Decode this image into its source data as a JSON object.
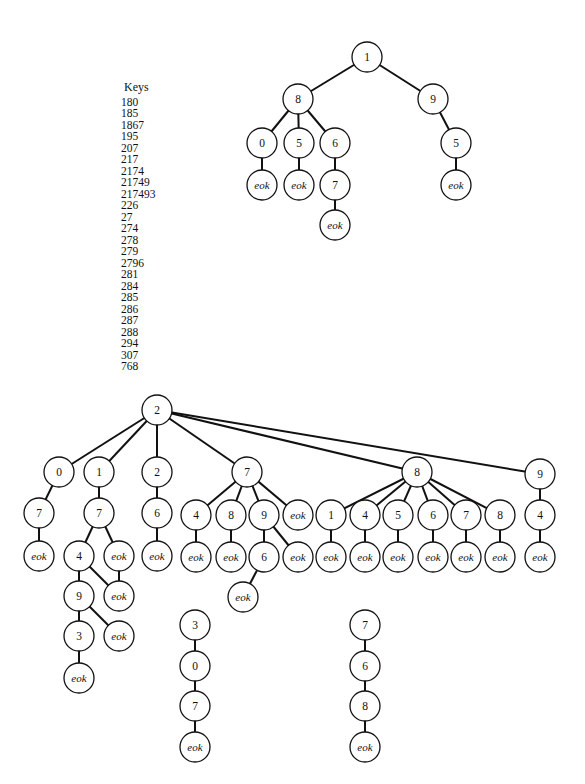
{
  "keys": {
    "title": "Keys",
    "items": [
      "180",
      "185",
      "1867",
      "195",
      "207",
      "217",
      "2174",
      "21749",
      "217493",
      "226",
      "27",
      "274",
      "278",
      "279",
      "2796",
      "281",
      "284",
      "285",
      "286",
      "287",
      "288",
      "294",
      "307",
      "768"
    ]
  },
  "style": {
    "stroke": "#111111",
    "node_fill": "#ffffff",
    "node_radius": 15
  },
  "trees": [
    {
      "name": "tree-1",
      "nodes": [
        {
          "id": "a1",
          "label": "1",
          "x": 367,
          "y": 57
        },
        {
          "id": "a8",
          "label": "8",
          "x": 298,
          "y": 99
        },
        {
          "id": "a9",
          "label": "9",
          "x": 433,
          "y": 99
        },
        {
          "id": "a80",
          "label": "0",
          "x": 262,
          "y": 143
        },
        {
          "id": "a85",
          "label": "5",
          "x": 299,
          "y": 143
        },
        {
          "id": "a86",
          "label": "6",
          "x": 335,
          "y": 143
        },
        {
          "id": "a95",
          "label": "5",
          "x": 456,
          "y": 143
        },
        {
          "id": "a80e",
          "label": "eok",
          "x": 262,
          "y": 185
        },
        {
          "id": "a85e",
          "label": "eok",
          "x": 299,
          "y": 185
        },
        {
          "id": "a867",
          "label": "7",
          "x": 335,
          "y": 185
        },
        {
          "id": "a95e",
          "label": "eok",
          "x": 456,
          "y": 185
        },
        {
          "id": "a867e",
          "label": "eok",
          "x": 335,
          "y": 225
        }
      ],
      "edges": [
        [
          "a1",
          "a8"
        ],
        [
          "a1",
          "a9"
        ],
        [
          "a8",
          "a80"
        ],
        [
          "a8",
          "a85"
        ],
        [
          "a8",
          "a86"
        ],
        [
          "a9",
          "a95"
        ],
        [
          "a80",
          "a80e"
        ],
        [
          "a85",
          "a85e"
        ],
        [
          "a86",
          "a867"
        ],
        [
          "a95",
          "a95e"
        ],
        [
          "a867",
          "a867e"
        ]
      ]
    },
    {
      "name": "tree-2",
      "nodes": [
        {
          "id": "b2",
          "label": "2",
          "x": 157,
          "y": 410
        },
        {
          "id": "b0",
          "label": "0",
          "x": 59,
          "y": 472
        },
        {
          "id": "b1",
          "label": "1",
          "x": 99,
          "y": 472
        },
        {
          "id": "b22",
          "label": "2",
          "x": 157,
          "y": 472
        },
        {
          "id": "b7",
          "label": "7",
          "x": 247,
          "y": 472
        },
        {
          "id": "b8",
          "label": "8",
          "x": 417,
          "y": 472
        },
        {
          "id": "b9",
          "label": "9",
          "x": 540,
          "y": 474
        },
        {
          "id": "b07",
          "label": "7",
          "x": 39,
          "y": 513
        },
        {
          "id": "b17",
          "label": "7",
          "x": 99,
          "y": 513
        },
        {
          "id": "b226",
          "label": "6",
          "x": 157,
          "y": 513
        },
        {
          "id": "b74",
          "label": "4",
          "x": 196,
          "y": 515
        },
        {
          "id": "b78",
          "label": "8",
          "x": 231,
          "y": 515
        },
        {
          "id": "b79",
          "label": "9",
          "x": 264,
          "y": 515
        },
        {
          "id": "b7e",
          "label": "eok",
          "x": 298,
          "y": 515
        },
        {
          "id": "b81",
          "label": "1",
          "x": 331,
          "y": 515
        },
        {
          "id": "b84",
          "label": "4",
          "x": 365,
          "y": 515
        },
        {
          "id": "b85",
          "label": "5",
          "x": 398,
          "y": 515
        },
        {
          "id": "b86",
          "label": "6",
          "x": 433,
          "y": 515
        },
        {
          "id": "b87",
          "label": "7",
          "x": 466,
          "y": 515
        },
        {
          "id": "b88",
          "label": "8",
          "x": 500,
          "y": 515
        },
        {
          "id": "b94",
          "label": "4",
          "x": 540,
          "y": 515
        },
        {
          "id": "b07e",
          "label": "eok",
          "x": 39,
          "y": 556
        },
        {
          "id": "b174",
          "label": "4",
          "x": 79,
          "y": 556
        },
        {
          "id": "b17e",
          "label": "eok",
          "x": 119,
          "y": 556
        },
        {
          "id": "b226e",
          "label": "eok",
          "x": 157,
          "y": 556
        },
        {
          "id": "b74e",
          "label": "eok",
          "x": 196,
          "y": 557
        },
        {
          "id": "b78e",
          "label": "eok",
          "x": 231,
          "y": 557
        },
        {
          "id": "b796",
          "label": "6",
          "x": 264,
          "y": 557
        },
        {
          "id": "b79e",
          "label": "eok",
          "x": 298,
          "y": 557
        },
        {
          "id": "b81e",
          "label": "eok",
          "x": 331,
          "y": 557
        },
        {
          "id": "b84e",
          "label": "eok",
          "x": 365,
          "y": 557
        },
        {
          "id": "b85e",
          "label": "eok",
          "x": 398,
          "y": 557
        },
        {
          "id": "b86e",
          "label": "eok",
          "x": 433,
          "y": 557
        },
        {
          "id": "b87e",
          "label": "eok",
          "x": 466,
          "y": 557
        },
        {
          "id": "b88e",
          "label": "eok",
          "x": 500,
          "y": 557
        },
        {
          "id": "b94e",
          "label": "eok",
          "x": 540,
          "y": 557
        },
        {
          "id": "b1749",
          "label": "9",
          "x": 79,
          "y": 596
        },
        {
          "id": "b174e",
          "label": "eok",
          "x": 119,
          "y": 596
        },
        {
          "id": "b796e",
          "label": "eok",
          "x": 243,
          "y": 597
        },
        {
          "id": "b17493",
          "label": "3",
          "x": 79,
          "y": 636
        },
        {
          "id": "b1749e",
          "label": "eok",
          "x": 119,
          "y": 636
        },
        {
          "id": "b17493e",
          "label": "eok",
          "x": 79,
          "y": 678
        }
      ],
      "edges": [
        [
          "b2",
          "b0"
        ],
        [
          "b2",
          "b1"
        ],
        [
          "b2",
          "b22"
        ],
        [
          "b2",
          "b7"
        ],
        [
          "b2",
          "b8"
        ],
        [
          "b2",
          "b9"
        ],
        [
          "b0",
          "b07"
        ],
        [
          "b1",
          "b17"
        ],
        [
          "b22",
          "b226"
        ],
        [
          "b7",
          "b74"
        ],
        [
          "b7",
          "b78"
        ],
        [
          "b7",
          "b79"
        ],
        [
          "b7",
          "b7e"
        ],
        [
          "b8",
          "b81"
        ],
        [
          "b8",
          "b84"
        ],
        [
          "b8",
          "b85"
        ],
        [
          "b8",
          "b86"
        ],
        [
          "b8",
          "b87"
        ],
        [
          "b8",
          "b88"
        ],
        [
          "b9",
          "b94"
        ],
        [
          "b07",
          "b07e"
        ],
        [
          "b17",
          "b174"
        ],
        [
          "b17",
          "b17e"
        ],
        [
          "b226",
          "b226e"
        ],
        [
          "b74",
          "b74e"
        ],
        [
          "b78",
          "b78e"
        ],
        [
          "b79",
          "b796"
        ],
        [
          "b79",
          "b79e"
        ],
        [
          "b81",
          "b81e"
        ],
        [
          "b84",
          "b84e"
        ],
        [
          "b85",
          "b85e"
        ],
        [
          "b86",
          "b86e"
        ],
        [
          "b87",
          "b87e"
        ],
        [
          "b88",
          "b88e"
        ],
        [
          "b94",
          "b94e"
        ],
        [
          "b174",
          "b1749"
        ],
        [
          "b174",
          "b174e"
        ],
        [
          "b17e",
          "b174e"
        ],
        [
          "b796",
          "b796e"
        ],
        [
          "b1749",
          "b17493"
        ],
        [
          "b1749",
          "b1749e"
        ],
        [
          "b17493",
          "b17493e"
        ]
      ]
    },
    {
      "name": "chain-3-0-7",
      "nodes": [
        {
          "id": "c3",
          "label": "3",
          "x": 195,
          "y": 625
        },
        {
          "id": "c0",
          "label": "0",
          "x": 195,
          "y": 666
        },
        {
          "id": "c7",
          "label": "7",
          "x": 195,
          "y": 706
        },
        {
          "id": "ce",
          "label": "eok",
          "x": 195,
          "y": 747
        }
      ],
      "edges": [
        [
          "c3",
          "c0"
        ],
        [
          "c0",
          "c7"
        ],
        [
          "c7",
          "ce"
        ]
      ]
    },
    {
      "name": "chain-7-6-8",
      "nodes": [
        {
          "id": "d7",
          "label": "7",
          "x": 365,
          "y": 625
        },
        {
          "id": "d6",
          "label": "6",
          "x": 365,
          "y": 666
        },
        {
          "id": "d8",
          "label": "8",
          "x": 365,
          "y": 706
        },
        {
          "id": "de",
          "label": "eok",
          "x": 365,
          "y": 747
        }
      ],
      "edges": [
        [
          "d7",
          "d6"
        ],
        [
          "d6",
          "d8"
        ],
        [
          "d8",
          "de"
        ]
      ]
    }
  ]
}
